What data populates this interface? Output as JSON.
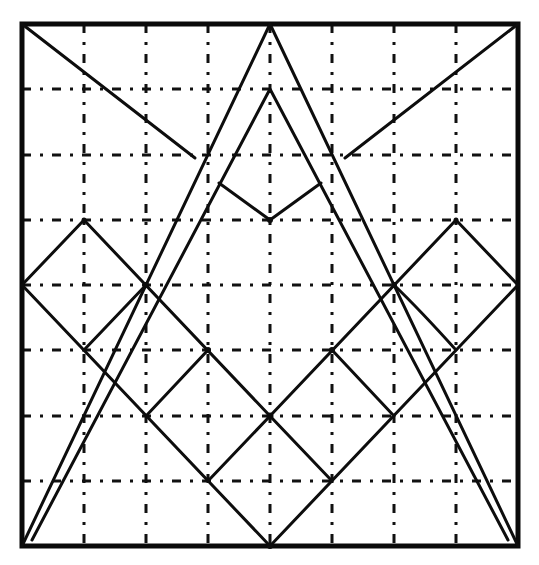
{
  "diagram": {
    "description": "Geometric line drawing on an 8x8 dash-dot grid inside a square frame: a tall outer triangle with an inner parallel triangle, corner diagonals meeting a central V, and a lattice of diamonds",
    "grid": {
      "columns": 8,
      "rows": 8,
      "style": "dash-dot"
    },
    "colors": {
      "ink": "#0d0d0d",
      "background": "#ffffff"
    },
    "frame": {
      "x0": 22,
      "y0": 24,
      "x1": 518,
      "y1": 546
    },
    "shapes": [
      {
        "name": "outer-triangle",
        "points": [
          [
            270,
            24
          ],
          [
            22,
            546
          ],
          [
            518,
            546
          ]
        ]
      },
      {
        "name": "inner-triangle",
        "points": [
          [
            270,
            89
          ],
          [
            32,
            540
          ],
          [
            508,
            540
          ]
        ]
      },
      {
        "name": "top-left-diagonal",
        "points": [
          [
            22,
            24
          ],
          [
            195,
            158
          ]
        ]
      },
      {
        "name": "top-right-diagonal",
        "points": [
          [
            518,
            24
          ],
          [
            345,
            158
          ]
        ]
      },
      {
        "name": "center-v",
        "points": [
          [
            219,
            183
          ],
          [
            270,
            220
          ],
          [
            321,
            183
          ]
        ]
      },
      {
        "name": "left-upper-zigzag",
        "points": [
          [
            22,
            285
          ],
          [
            84,
            220
          ],
          [
            270,
            416
          ],
          [
            456,
            220
          ],
          [
            518,
            285
          ]
        ]
      },
      {
        "name": "left-lower-diagonal",
        "points": [
          [
            22,
            285
          ],
          [
            270,
            546
          ]
        ]
      },
      {
        "name": "right-lower-diagonal",
        "points": [
          [
            518,
            285
          ],
          [
            270,
            546
          ]
        ]
      },
      {
        "name": "left-cross-1",
        "points": [
          [
            84,
            350
          ],
          [
            146,
            285
          ]
        ]
      },
      {
        "name": "left-cross-2",
        "points": [
          [
            146,
            416
          ],
          [
            208,
            350
          ]
        ]
      },
      {
        "name": "left-cross-3",
        "points": [
          [
            208,
            481
          ],
          [
            270,
            416
          ]
        ]
      },
      {
        "name": "right-cross-1",
        "points": [
          [
            456,
            350
          ],
          [
            394,
            285
          ]
        ]
      },
      {
        "name": "right-cross-2",
        "points": [
          [
            394,
            416
          ],
          [
            332,
            350
          ]
        ]
      },
      {
        "name": "right-cross-3",
        "points": [
          [
            332,
            481
          ],
          [
            270,
            416
          ]
        ]
      }
    ]
  }
}
